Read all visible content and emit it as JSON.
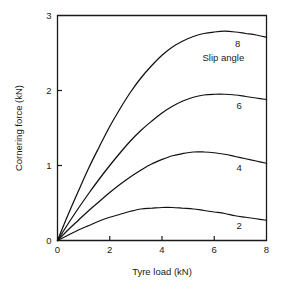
{
  "chart_data": {
    "type": "line",
    "title": "",
    "xlabel": "Tyre load (kN)",
    "ylabel": "Cornering force (kN)",
    "xlim": [
      0,
      8
    ],
    "ylim": [
      0,
      3
    ],
    "xticks": [
      0,
      2,
      4,
      6,
      8
    ],
    "xtick_labels": [
      "0",
      "2",
      "4",
      "6",
      "8"
    ],
    "yticks": [
      0,
      1,
      2,
      3
    ],
    "ytick_labels": [
      "0",
      "1",
      "2",
      "3"
    ],
    "grid": false,
    "legend": "none",
    "annotations": [
      {
        "text": "Slip angle",
        "x": 6.35,
        "y": 2.44
      }
    ],
    "series": [
      {
        "name": "8",
        "label": "8",
        "label_x": 6.9,
        "label_y": 2.62,
        "x": [
          0,
          0.4,
          0.8,
          1.2,
          1.6,
          2.0,
          2.4,
          2.8,
          3.2,
          3.6,
          4.0,
          4.4,
          4.8,
          5.2,
          5.6,
          6.0,
          6.4,
          6.8,
          7.2,
          7.6,
          8.0
        ],
        "y": [
          0,
          0.34,
          0.66,
          0.97,
          1.25,
          1.52,
          1.76,
          1.98,
          2.17,
          2.33,
          2.47,
          2.58,
          2.66,
          2.72,
          2.76,
          2.78,
          2.79,
          2.78,
          2.76,
          2.74,
          2.71
        ]
      },
      {
        "name": "6",
        "label": "6",
        "label_x": 6.95,
        "label_y": 1.8,
        "x": [
          0,
          0.4,
          0.8,
          1.2,
          1.6,
          2.0,
          2.4,
          2.8,
          3.2,
          3.6,
          4.0,
          4.4,
          4.8,
          5.2,
          5.6,
          6.0,
          6.4,
          6.8,
          7.2,
          7.6,
          8.0
        ],
        "y": [
          0,
          0.22,
          0.43,
          0.63,
          0.82,
          1.0,
          1.17,
          1.33,
          1.47,
          1.59,
          1.7,
          1.79,
          1.86,
          1.91,
          1.94,
          1.95,
          1.95,
          1.94,
          1.92,
          1.9,
          1.88
        ]
      },
      {
        "name": "4",
        "label": "4",
        "label_x": 6.95,
        "label_y": 0.97,
        "x": [
          0,
          0.4,
          0.8,
          1.2,
          1.6,
          2.0,
          2.4,
          2.8,
          3.2,
          3.6,
          4.0,
          4.4,
          4.8,
          5.2,
          5.6,
          6.0,
          6.4,
          6.8,
          7.2,
          7.6,
          8.0
        ],
        "y": [
          0,
          0.14,
          0.27,
          0.4,
          0.52,
          0.64,
          0.75,
          0.85,
          0.94,
          1.02,
          1.08,
          1.13,
          1.16,
          1.18,
          1.18,
          1.17,
          1.15,
          1.12,
          1.09,
          1.06,
          1.03
        ]
      },
      {
        "name": "2",
        "label": "2",
        "label_x": 6.95,
        "label_y": 0.2,
        "x": [
          0,
          0.4,
          0.8,
          1.2,
          1.6,
          2.0,
          2.4,
          2.8,
          3.2,
          3.6,
          4.0,
          4.4,
          4.8,
          5.2,
          5.6,
          6.0,
          6.4,
          6.8,
          7.2,
          7.6,
          8.0
        ],
        "y": [
          0,
          0.07,
          0.14,
          0.2,
          0.26,
          0.31,
          0.35,
          0.39,
          0.42,
          0.43,
          0.44,
          0.44,
          0.43,
          0.42,
          0.4,
          0.38,
          0.36,
          0.33,
          0.31,
          0.29,
          0.27
        ]
      }
    ],
    "colors": {
      "curve": "#111111",
      "axis": "#1a1a1a",
      "background": "#ffffff"
    }
  }
}
